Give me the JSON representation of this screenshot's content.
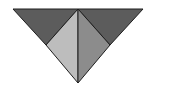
{
  "diagram": {
    "width": 179,
    "height": 98,
    "stroke": "#1e1e1e",
    "shapes": [
      {
        "name": "left-dark-triangle",
        "points": "13,9 78,9 46,45",
        "fill": "#5c5c5c"
      },
      {
        "name": "right-dark-triangle",
        "points": "78,9 143,9 110,45",
        "fill": "#5c5c5c"
      },
      {
        "name": "left-light-triangle",
        "points": "78,9 46,45 78,83",
        "fill": "#bdbdbd"
      },
      {
        "name": "right-medium-triangle",
        "points": "78,9 110,45 78,83",
        "fill": "#8c8c8c"
      }
    ]
  }
}
